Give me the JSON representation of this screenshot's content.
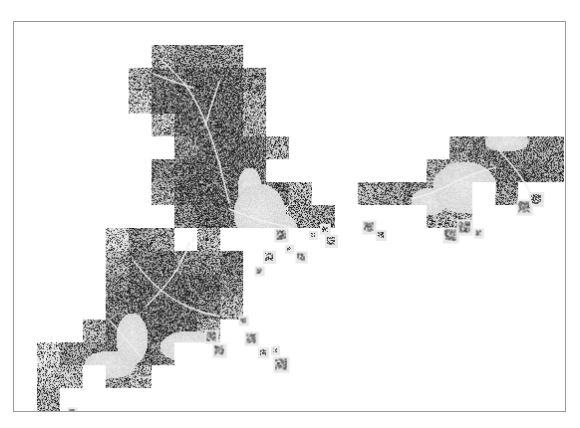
{
  "figure": {
    "type": "raster-map-mosaic",
    "title": "",
    "caption": "",
    "background_color": "#ffffff",
    "frame": {
      "visible": true,
      "color": "#9a9a9a",
      "line_width_px": 1,
      "x": 13,
      "y": 21,
      "width": 553,
      "height": 391
    },
    "colors": {
      "land_dark": "#3a3a3a",
      "land_mid": "#6e6e6e",
      "land_light": "#b4b4b4",
      "water": "#d8d8d8",
      "tile_halo": "#e8e8e8",
      "paper": "#ffffff"
    },
    "legend": {
      "visible": false,
      "entries": []
    },
    "axes": {
      "visible": false,
      "tick_labels": []
    },
    "scalebar": {
      "visible": false
    },
    "north_arrow": {
      "visible": false
    },
    "labels": []
  },
  "chart_data": {
    "type": "heatmap",
    "title": "",
    "xlabel": "",
    "ylabel": "",
    "grid": false,
    "legend_position": "none",
    "xlim": [
      0,
      553
    ],
    "ylim": [
      0,
      391
    ],
    "tile_grid": {
      "cell_width": 23,
      "cell_height": 23,
      "cols": 24,
      "rows": 17
    },
    "regions": [
      {
        "name": "northern-inland-block",
        "centroid": [
          195,
          70
        ],
        "density": 0.86,
        "tone": "land_dark",
        "note": "dense dark mountainous/forested terrain with bright river valley"
      },
      {
        "name": "central-urban-core",
        "centroid": [
          200,
          175
        ],
        "density": 0.92,
        "tone": "land_dark",
        "note": "dense built-up grid adjoining a light-gray harbour"
      },
      {
        "name": "harbour-bay",
        "centroid": [
          245,
          190
        ],
        "density": 0.15,
        "tone": "water",
        "note": "light gray open water wedge"
      },
      {
        "name": "eastern-coastal-strip",
        "centroid": [
          300,
          200
        ],
        "density": 0.58,
        "tone": "land_mid",
        "note": "narrow stair-stepped coastal tiles trailing south-east"
      },
      {
        "name": "southwest-metro-block",
        "centroid": [
          130,
          280
        ],
        "density": 0.88,
        "tone": "land_dark",
        "note": "second large urban mass with radiating roads"
      },
      {
        "name": "southwest-coast-fragments",
        "centroid": [
          60,
          350
        ],
        "density": 0.45,
        "tone": "land_mid",
        "note": "scattered coastal tiles along an indented shoreline"
      },
      {
        "name": "southern-outlier-tile",
        "centroid": [
          40,
          400
        ],
        "density": 0.4,
        "tone": "land_mid",
        "note": "isolated small tile cluster near the bottom-left frame edge"
      },
      {
        "name": "eastern-island-west-arm",
        "centroid": [
          400,
          195
        ],
        "density": 0.5,
        "tone": "land_mid",
        "note": "western arm of the separated landmass"
      },
      {
        "name": "eastern-island-main",
        "centroid": [
          490,
          165
        ],
        "density": 0.72,
        "tone": "land_mid",
        "note": "main body of the eastern landmass with fine road network"
      },
      {
        "name": "eastern-island-inner-sea",
        "centroid": [
          450,
          165
        ],
        "density": 0.12,
        "tone": "water",
        "note": "light inner sea/strait enclosed by the eastern landmass"
      }
    ],
    "values_note": "Pixel intensities range from near-black (0) for dense built-up/road texture to white (255) for no-data sea; mid gray ~0.85 for water bodies inside the mosaic."
  }
}
